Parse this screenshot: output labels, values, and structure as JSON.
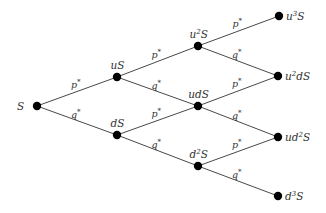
{
  "diagram": {
    "nodes": [
      {
        "id": "S",
        "base": "",
        "exp": "",
        "tail": "S",
        "x": 37,
        "y": 106,
        "label_pos": "left"
      },
      {
        "id": "uS",
        "base": "u",
        "exp": "",
        "tail": "S",
        "x": 117,
        "y": 77,
        "label_pos": "above"
      },
      {
        "id": "dS",
        "base": "d",
        "exp": "",
        "tail": "S",
        "x": 117,
        "y": 135,
        "label_pos": "above"
      },
      {
        "id": "u2S",
        "base": "u",
        "exp": "2",
        "tail": "S",
        "x": 198,
        "y": 46,
        "label_pos": "above"
      },
      {
        "id": "udS",
        "base": "ud",
        "exp": "",
        "tail": "S",
        "x": 198,
        "y": 106,
        "label_pos": "above"
      },
      {
        "id": "d2S",
        "base": "d",
        "exp": "2",
        "tail": "S",
        "x": 198,
        "y": 166,
        "label_pos": "above"
      },
      {
        "id": "u3S",
        "base": "u",
        "exp": "3",
        "tail": "S",
        "x": 279,
        "y": 16,
        "label_pos": "right"
      },
      {
        "id": "u2dS",
        "base": "u",
        "exp": "2",
        "tail": "dS",
        "x": 278,
        "y": 76,
        "label_pos": "right"
      },
      {
        "id": "ud2S",
        "base": "ud",
        "exp": "2",
        "tail": "S",
        "x": 278,
        "y": 137,
        "label_pos": "right"
      },
      {
        "id": "d3S",
        "base": "d",
        "exp": "3",
        "tail": "S",
        "x": 278,
        "y": 196,
        "label_pos": "right"
      }
    ],
    "edges": [
      {
        "from": "S",
        "to": "uS",
        "label": "p*"
      },
      {
        "from": "S",
        "to": "dS",
        "label": "q*"
      },
      {
        "from": "uS",
        "to": "u2S",
        "label": "p*"
      },
      {
        "from": "uS",
        "to": "udS",
        "label": "q*"
      },
      {
        "from": "dS",
        "to": "udS",
        "label": "p*"
      },
      {
        "from": "dS",
        "to": "d2S",
        "label": "q*"
      },
      {
        "from": "u2S",
        "to": "u3S",
        "label": "p*"
      },
      {
        "from": "u2S",
        "to": "u2dS",
        "label": "q*"
      },
      {
        "from": "udS",
        "to": "u2dS",
        "label": "p*"
      },
      {
        "from": "udS",
        "to": "ud2S",
        "label": "q*"
      },
      {
        "from": "d2S",
        "to": "ud2S",
        "label": "p*"
      },
      {
        "from": "d2S",
        "to": "d3S",
        "label": "q*"
      }
    ],
    "colors": {
      "node": "#000000",
      "edge": "#333333",
      "text": "#333333"
    }
  }
}
